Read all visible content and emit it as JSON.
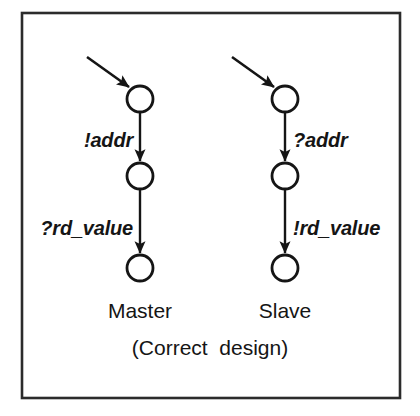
{
  "figure": {
    "kind": "state-transition-diagram",
    "caption": "(Correct  design)",
    "border_color": "#2b2b2b",
    "ink_color": "#151515",
    "background": "#ffffff",
    "frame": {
      "x": 22,
      "y": 13,
      "width": 378,
      "height": 385
    },
    "columns": [
      {
        "id": "master",
        "name": "Master",
        "name_label": "Master",
        "center_x": 140,
        "states": [
          {
            "id": "master-state-0",
            "cx": 140,
            "cy": 99,
            "r": 13
          },
          {
            "id": "master-state-1",
            "cx": 140,
            "cy": 176,
            "r": 13
          },
          {
            "id": "master-state-2",
            "cx": 140,
            "cy": 268,
            "r": 13
          }
        ],
        "entry_arrow": {
          "x1": 87,
          "y1": 57,
          "x2": 131,
          "y2": 88
        },
        "transitions": [
          {
            "id": "master-t0",
            "label": "!addr",
            "label_side": "left",
            "label_x": 133,
            "label_y": 140,
            "from": "master-state-0",
            "to": "master-state-1"
          },
          {
            "id": "master-t1",
            "label": "?rd_value",
            "label_side": "left",
            "label_x": 133,
            "label_y": 228,
            "from": "master-state-1",
            "to": "master-state-2"
          }
        ],
        "name_x": 140,
        "name_y": 310
      },
      {
        "id": "slave",
        "name": "Slave",
        "name_label": "Slave",
        "center_x": 285,
        "states": [
          {
            "id": "slave-state-0",
            "cx": 285,
            "cy": 99,
            "r": 13
          },
          {
            "id": "slave-state-1",
            "cx": 285,
            "cy": 176,
            "r": 13
          },
          {
            "id": "slave-state-2",
            "cx": 285,
            "cy": 268,
            "r": 13
          }
        ],
        "entry_arrow": {
          "x1": 232,
          "y1": 57,
          "x2": 276,
          "y2": 88
        },
        "transitions": [
          {
            "id": "slave-t0",
            "label": "?addr",
            "label_side": "right",
            "label_x": 293,
            "label_y": 140,
            "from": "slave-state-0",
            "to": "slave-state-1"
          },
          {
            "id": "slave-t1",
            "label": "!rd_value",
            "label_side": "right",
            "label_x": 293,
            "label_y": 228,
            "from": "slave-state-1",
            "to": "slave-state-2"
          }
        ],
        "name_x": 285,
        "name_y": 310
      }
    ],
    "caption_x": 210,
    "caption_y": 347
  }
}
